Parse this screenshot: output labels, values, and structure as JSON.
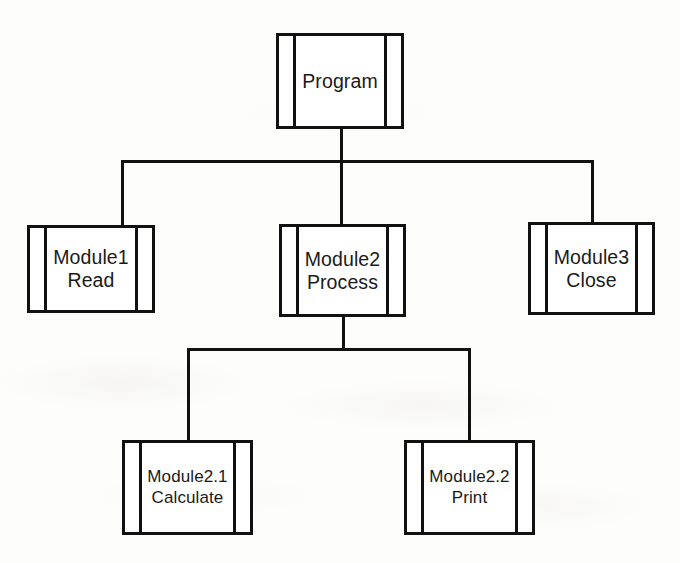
{
  "diagram": {
    "type": "structure-chart",
    "background_color": "#fdfdfc",
    "line_color": "#111111",
    "text_color": "#1a1a1a",
    "nodes": {
      "root": {
        "id": "program",
        "label": "Program",
        "level": 1
      },
      "level2": [
        {
          "id": "module1",
          "label": "Module1\nRead",
          "level": 2
        },
        {
          "id": "module2",
          "label": "Module2\nProcess",
          "level": 2
        },
        {
          "id": "module3",
          "label": "Module3\nClose",
          "level": 2
        }
      ],
      "level3": [
        {
          "id": "module21",
          "label": "Module2.1\nCalculate",
          "level": 3
        },
        {
          "id": "module22",
          "label": "Module2.2\nPrint",
          "level": 3
        }
      ]
    },
    "edges": [
      {
        "from": "program",
        "to": "module1"
      },
      {
        "from": "program",
        "to": "module2"
      },
      {
        "from": "program",
        "to": "module3"
      },
      {
        "from": "module2",
        "to": "module21"
      },
      {
        "from": "module2",
        "to": "module22"
      }
    ]
  }
}
